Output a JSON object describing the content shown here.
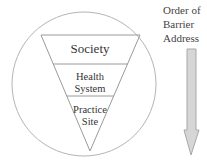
{
  "diagram": {
    "levels": [
      {
        "label": "Society"
      },
      {
        "label_line1": "Health",
        "label_line2": "System"
      },
      {
        "label_line1": "Practice",
        "label_line2": "Site"
      }
    ],
    "side_label": {
      "line1": "Order of",
      "line2": "Barrier",
      "line3": "Address"
    },
    "colors": {
      "outline": "#b5b5b5",
      "arrow_fill": "#d6d6d6",
      "arrow_stroke": "#a8a8a8",
      "text": "#333333"
    }
  }
}
